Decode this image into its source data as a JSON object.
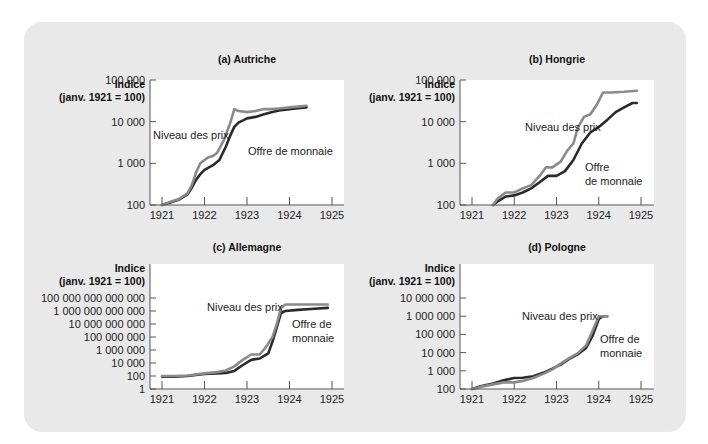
{
  "chart_data": [
    {
      "id": "a",
      "type": "line",
      "title": "(a) Autriche",
      "ylabel_lines": [
        "Indice",
        "(janv. 1921 = 100)"
      ],
      "xlabel": "",
      "yscale": "log",
      "ylim": [
        100,
        100000
      ],
      "yticks": [
        100,
        1000,
        10000,
        100000
      ],
      "ytick_labels": [
        "100",
        "1 000",
        "10 000",
        "100 000"
      ],
      "xlim": [
        1921,
        1925
      ],
      "xticks": [
        1921,
        1922,
        1923,
        1924,
        1925
      ],
      "xtick_labels": [
        "1921",
        "1922",
        "1923",
        "1924",
        "1925"
      ],
      "series": [
        {
          "name": "Niveau des prix",
          "color": "#8a8a8a",
          "x": [
            1921.0,
            1921.2,
            1921.4,
            1921.6,
            1921.7,
            1921.8,
            1921.9,
            1922.0,
            1922.1,
            1922.2,
            1922.3,
            1922.45,
            1922.6,
            1922.7,
            1922.8,
            1923.0,
            1923.2,
            1923.4,
            1923.6,
            1923.8,
            1924.0,
            1924.2,
            1924.4
          ],
          "y": [
            100,
            120,
            140,
            190,
            300,
            600,
            1000,
            1200,
            1400,
            1500,
            1800,
            3500,
            9000,
            20000,
            18000,
            17000,
            18000,
            20000,
            20000,
            21000,
            22000,
            23000,
            24000
          ]
        },
        {
          "name": "Offre de monnaie",
          "color": "#2a2a2a",
          "x": [
            1921.0,
            1921.2,
            1921.4,
            1921.6,
            1921.7,
            1921.8,
            1921.9,
            1922.0,
            1922.2,
            1922.35,
            1922.5,
            1922.6,
            1922.7,
            1922.8,
            1923.0,
            1923.2,
            1923.4,
            1923.6,
            1923.8,
            1924.0,
            1924.2,
            1924.4
          ],
          "y": [
            100,
            115,
            135,
            180,
            260,
            400,
            550,
            700,
            900,
            1200,
            2500,
            4500,
            7500,
            9500,
            12000,
            13000,
            15000,
            17000,
            19000,
            20000,
            21000,
            22000
          ]
        }
      ],
      "annotations": [
        {
          "text": "Niveau des prix",
          "series": "Niveau des prix"
        },
        {
          "text": "Offre de monnaie",
          "series": "Offre de monnaie"
        }
      ],
      "grid": false,
      "legend": "inline annotations"
    },
    {
      "id": "b",
      "type": "line",
      "title": "(b) Hongrie",
      "ylabel_lines": [
        "Indice",
        "(janv. 1921 = 100)"
      ],
      "xlabel": "",
      "yscale": "log",
      "ylim": [
        100,
        100000
      ],
      "yticks": [
        100,
        1000,
        10000,
        100000
      ],
      "ytick_labels": [
        "100",
        "1 000",
        "10 000",
        "100 000"
      ],
      "xlim": [
        1921,
        1925
      ],
      "xticks": [
        1921,
        1922,
        1923,
        1924,
        1925
      ],
      "xtick_labels": [
        "1921",
        "1922",
        "1923",
        "1924",
        "1925"
      ],
      "series": [
        {
          "name": "Niveau des prix",
          "color": "#8a8a8a",
          "x": [
            1921.5,
            1921.6,
            1921.8,
            1922.0,
            1922.2,
            1922.4,
            1922.6,
            1922.75,
            1922.9,
            1923.1,
            1923.25,
            1923.4,
            1923.5,
            1923.65,
            1923.8,
            1923.95,
            1924.1,
            1924.3,
            1924.6,
            1924.9
          ],
          "y": [
            100,
            140,
            200,
            200,
            250,
            300,
            500,
            800,
            800,
            1100,
            2000,
            3000,
            7000,
            13000,
            15000,
            25000,
            50000,
            50000,
            52000,
            55000
          ]
        },
        {
          "name": "Offre de monnaie",
          "color": "#2a2a2a",
          "x": [
            1921.5,
            1921.6,
            1921.8,
            1922.0,
            1922.2,
            1922.4,
            1922.6,
            1922.8,
            1923.0,
            1923.2,
            1923.4,
            1923.6,
            1923.8,
            1924.0,
            1924.2,
            1924.4,
            1924.6,
            1924.8,
            1924.9
          ],
          "y": [
            100,
            120,
            160,
            170,
            200,
            250,
            350,
            500,
            500,
            650,
            1200,
            3000,
            5500,
            7500,
            11000,
            17000,
            22000,
            28000,
            28000
          ]
        }
      ],
      "annotations": [
        {
          "text": "Niveau des prix",
          "series": "Niveau des prix"
        },
        {
          "text": "Offre",
          "series": "Offre de monnaie"
        },
        {
          "text": "de monnaie",
          "series": "Offre de monnaie"
        }
      ],
      "grid": false,
      "legend": "inline annotations"
    },
    {
      "id": "c",
      "type": "line",
      "title": "(c) Allemagne",
      "ylabel_lines": [
        "Indice",
        "(janv. 1921 = 100)"
      ],
      "xlabel": "",
      "yscale": "log",
      "ylim": [
        1,
        100000000000000
      ],
      "yticks": [
        1,
        100,
        10000,
        1000000,
        100000000,
        10000000000,
        1000000000000,
        100000000000000
      ],
      "ytick_labels": [
        "1",
        "100",
        "10 000",
        "1 000 000",
        "100 000 000",
        "10 000 000 000",
        "1 000 000 000 000",
        "100 000 000 000 000"
      ],
      "xlim": [
        1921,
        1925
      ],
      "xticks": [
        1921,
        1922,
        1923,
        1924,
        1925
      ],
      "xtick_labels": [
        "1921",
        "1922",
        "1923",
        "1924",
        "1925"
      ],
      "series": [
        {
          "name": "Niveau des prix",
          "color": "#8a8a8a",
          "x": [
            1921.0,
            1921.3,
            1921.6,
            1922.0,
            1922.3,
            1922.5,
            1922.7,
            1922.9,
            1923.1,
            1923.3,
            1923.45,
            1923.6,
            1923.7,
            1923.8,
            1923.9,
            1924.2,
            1924.5,
            1924.9
          ],
          "y": [
            100,
            100,
            120,
            250,
            400,
            700,
            3000,
            30000,
            200000,
            200000,
            3000000,
            100000000,
            10000000000,
            3000000000000,
            10000000000000.0,
            10000000000000.0,
            10000000000000.0,
            10000000000000.0
          ]
        },
        {
          "name": "Offre de monnaie",
          "color": "#2a2a2a",
          "x": [
            1921.0,
            1921.3,
            1921.6,
            1922.0,
            1922.3,
            1922.5,
            1922.7,
            1922.9,
            1923.1,
            1923.3,
            1923.5,
            1923.6,
            1923.7,
            1923.8,
            1923.9,
            1924.2,
            1924.5,
            1924.9
          ],
          "y": [
            80,
            80,
            100,
            200,
            250,
            300,
            600,
            5000,
            30000,
            50000,
            300000,
            20000000,
            3000000000,
            500000000000,
            1000000000000,
            1500000000000,
            2000000000000,
            3000000000000
          ]
        }
      ],
      "annotations": [
        {
          "text": "Niveau des prix",
          "series": "Niveau des prix"
        },
        {
          "text": "Offre de",
          "series": "Offre de monnaie"
        },
        {
          "text": "monnaie",
          "series": "Offre de monnaie"
        }
      ],
      "grid": false,
      "legend": "inline annotations"
    },
    {
      "id": "d",
      "type": "line",
      "title": "(d) Pologne",
      "ylabel_lines": [
        "Indice",
        "(janv. 1921 = 100)"
      ],
      "xlabel": "",
      "yscale": "log",
      "ylim": [
        100,
        10000000
      ],
      "yticks": [
        100,
        1000,
        10000,
        100000,
        1000000,
        10000000
      ],
      "ytick_labels": [
        "100",
        "1 000",
        "10 000",
        "100 000",
        "1 000 000",
        "10 000 000"
      ],
      "xlim": [
        1921,
        1925
      ],
      "xticks": [
        1921,
        1922,
        1923,
        1924,
        1925
      ],
      "xtick_labels": [
        "1921",
        "1922",
        "1923",
        "1924",
        "1925"
      ],
      "series": [
        {
          "name": "Niveau des prix",
          "color": "#8a8a8a",
          "x": [
            1921.0,
            1921.2,
            1921.5,
            1921.75,
            1922.0,
            1922.2,
            1922.45,
            1922.7,
            1922.9,
            1923.1,
            1923.3,
            1923.5,
            1923.7,
            1923.85,
            1924.0,
            1924.1,
            1924.2
          ],
          "y": [
            100,
            130,
            180,
            230,
            230,
            280,
            400,
            700,
            1200,
            2500,
            5000,
            9000,
            25000,
            150000,
            1000000,
            1000000,
            1000000
          ]
        },
        {
          "name": "Offre de monnaie",
          "color": "#2a2a2a",
          "x": [
            1921.0,
            1921.2,
            1921.5,
            1921.75,
            1922.0,
            1922.2,
            1922.45,
            1922.7,
            1922.9,
            1923.1,
            1923.3,
            1923.5,
            1923.7,
            1923.85,
            1924.0,
            1924.1,
            1924.2
          ],
          "y": [
            100,
            140,
            200,
            300,
            400,
            420,
            500,
            800,
            1300,
            2200,
            4500,
            8000,
            18000,
            80000,
            700000,
            1000000,
            1000000
          ]
        }
      ],
      "annotations": [
        {
          "text": "Niveau des prix",
          "series": "Niveau des prix"
        },
        {
          "text": "Offre de",
          "series": "Offre de monnaie"
        },
        {
          "text": "monnaie",
          "series": "Offre de monnaie"
        }
      ],
      "grid": false,
      "legend": "inline annotations"
    }
  ],
  "layout": {
    "panel_bg": "#e9e9e9",
    "plot_bg": "#ffffff",
    "axis_color": "#555555"
  }
}
